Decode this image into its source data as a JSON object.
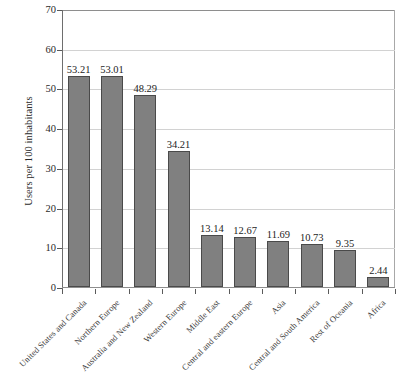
{
  "chart_data": {
    "type": "bar",
    "title": "",
    "subtitle": "",
    "xlabel": "",
    "ylabel": "Users per 100 inhabitants",
    "ylim": [
      0,
      70
    ],
    "ytick_step": 10,
    "yticks": [
      70,
      60,
      50,
      40,
      30,
      20,
      10,
      0
    ],
    "grid": true,
    "legend": null,
    "orientation": "vertical",
    "bar_color": "#808080",
    "bar_edge_color": "#4a4a4a",
    "gridline_color": "#d2d2d2",
    "axis_color": "#6e6e6e",
    "categories": [
      "United States and Canada",
      "Northern Europe",
      "Australia and New Zealand",
      "Western Europe",
      "Middle East",
      "Central and eastern Europe",
      "Asia",
      "Central and South America",
      "Rest of Oceania",
      "Africa"
    ],
    "values": [
      53.21,
      53.01,
      48.29,
      34.21,
      13.14,
      12.67,
      11.69,
      10.73,
      9.35,
      2.44
    ],
    "value_labels": [
      "53.21",
      "53.01",
      "48.29",
      "34.21",
      "13.14",
      "12.67",
      "11.69",
      "10.73",
      "9.35",
      "2.44"
    ]
  }
}
